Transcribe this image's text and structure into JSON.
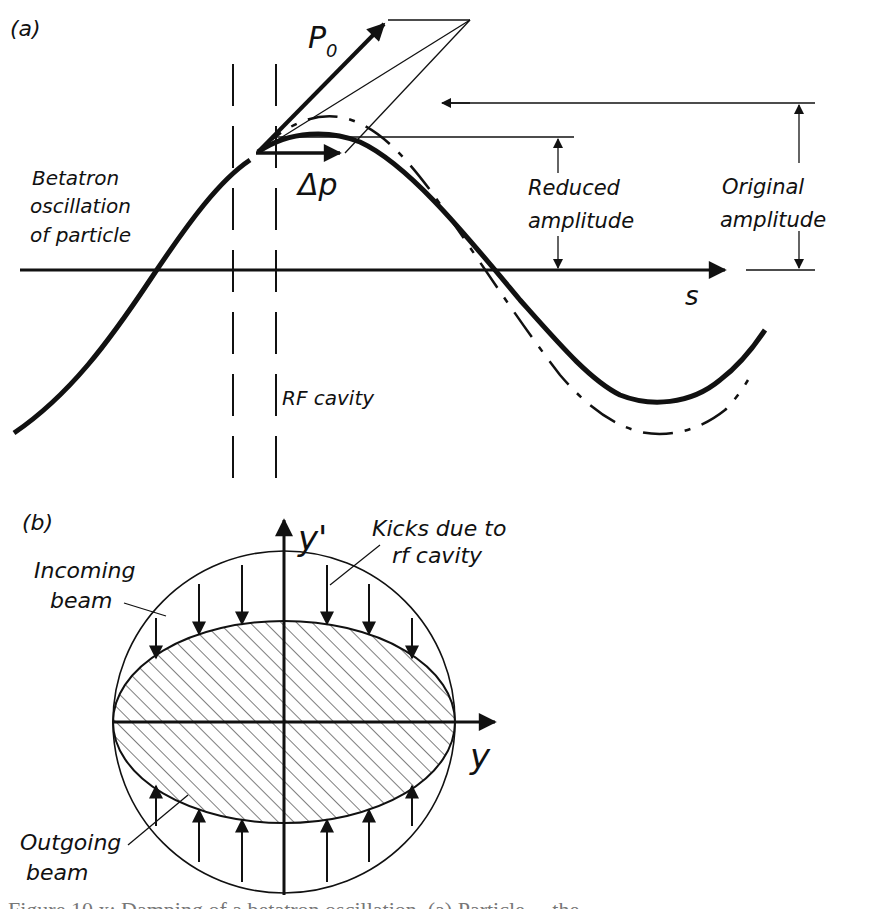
{
  "panel_a": {
    "label": "(a)",
    "momentum_label": "P",
    "momentum_subscript": "0",
    "kick_label": "Δp",
    "betatron_label_line1": "Betatron",
    "betatron_label_line2": "oscillation",
    "betatron_label_line3": "of particle",
    "reduced_label_line1": "Reduced",
    "reduced_label_line2": "amplitude",
    "original_label_line1": "Original",
    "original_label_line2": "amplitude",
    "axis_label": "s",
    "cavity_label": "RF cavity"
  },
  "panel_b": {
    "label": "(b)",
    "y_axis_label": "y'",
    "x_axis_label": "y",
    "kicks_label_line1": "Kicks due to",
    "kicks_label_line2": "rf cavity",
    "incoming_label_line1": "Incoming",
    "incoming_label_line2": "beam",
    "outgoing_label_line1": "Outgoing",
    "outgoing_label_line2": "beam"
  },
  "caption": {
    "text": "Figure 10.x: Damping of a betatron oscillation. (a) Particle ... the ..."
  },
  "colors": {
    "ink": "#111111",
    "background": "#ffffff"
  }
}
